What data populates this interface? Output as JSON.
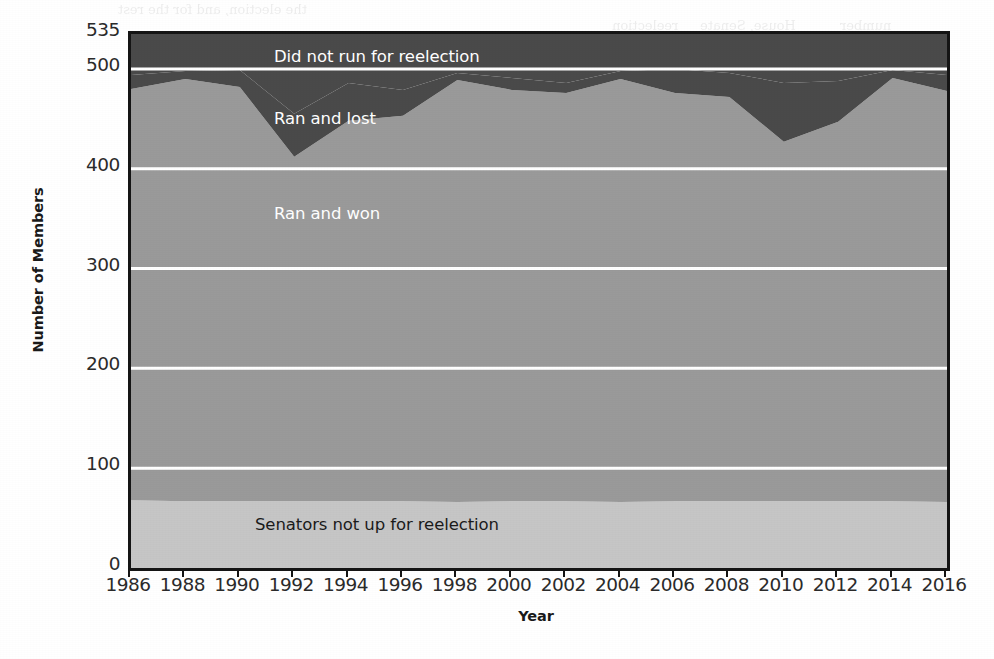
{
  "chart_data": {
    "type": "area",
    "stacked": true,
    "title": "",
    "xlabel": "Year",
    "ylabel": "Number of Members",
    "xlim": [
      1986,
      2016
    ],
    "ylim": [
      0,
      535
    ],
    "yticks": [
      0,
      100,
      200,
      300,
      400,
      500,
      535
    ],
    "ytick_labels": [
      "0",
      "100",
      "200",
      "300",
      "400",
      "500",
      "535"
    ],
    "xticks": [
      1986,
      1988,
      1990,
      1992,
      1994,
      1996,
      1998,
      2000,
      2002,
      2004,
      2006,
      2008,
      2010,
      2012,
      2014,
      2016
    ],
    "xtick_labels": [
      "1986",
      "1988",
      "1990",
      "1992",
      "1994",
      "1996",
      "1998",
      "2000",
      "2002",
      "2004",
      "2006",
      "2008",
      "2010",
      "2012",
      "2014",
      "2016"
    ],
    "x": [
      1986,
      1988,
      1990,
      1992,
      1994,
      1996,
      1998,
      2000,
      2002,
      2004,
      2006,
      2008,
      2010,
      2012,
      2014,
      2016
    ],
    "grid": "horizontal-white-gridlines",
    "legend": "inline-labels-on-bands",
    "series": [
      {
        "name": "Senators not up for reelection",
        "color": "#c6c6c6",
        "label_color": "#1b1b1b",
        "stack_order": 1,
        "values": [
          68,
          67,
          67,
          67,
          67,
          67,
          66,
          67,
          67,
          66,
          67,
          67,
          67,
          67,
          67,
          66
        ]
      },
      {
        "name": "Ran and won",
        "color": "#9a9a9a",
        "label_color": "#ffffff",
        "stack_order": 2,
        "values": [
          412,
          423,
          415,
          345,
          381,
          386,
          423,
          412,
          409,
          424,
          409,
          405,
          360,
          380,
          424,
          412
        ]
      },
      {
        "name": "Ran and lost",
        "color": "#4a4a4a",
        "label_color": "#ffffff",
        "stack_order": 3,
        "values": [
          14,
          8,
          17,
          43,
          38,
          26,
          7,
          12,
          10,
          8,
          24,
          24,
          59,
          41,
          8,
          16
        ]
      },
      {
        "name": "Did not run for reelection",
        "color": "#4a4a4a",
        "label_color": "#ffffff",
        "stack_order": 4,
        "values": [
          41,
          37,
          36,
          80,
          49,
          56,
          39,
          44,
          49,
          37,
          35,
          39,
          49,
          47,
          36,
          41
        ]
      }
    ],
    "cumulative_boundaries": {
      "note": "stacked running totals used to draw the band edges, bottom-up",
      "senators_top": [
        68,
        67,
        67,
        67,
        67,
        67,
        66,
        67,
        67,
        66,
        67,
        67,
        67,
        67,
        67,
        66
      ],
      "ran_and_won_top": [
        480,
        490,
        482,
        412,
        448,
        453,
        489,
        479,
        476,
        490,
        476,
        472,
        427,
        447,
        491,
        478
      ],
      "ran_and_lost_top": [
        494,
        498,
        499,
        455,
        486,
        479,
        496,
        491,
        486,
        498,
        500,
        496,
        486,
        488,
        499,
        494
      ],
      "total_top": [
        535,
        535,
        535,
        535,
        535,
        535,
        535,
        535,
        535,
        535,
        535,
        535,
        535,
        535,
        535,
        535
      ]
    },
    "band_labels": [
      {
        "text": "Did not run for reelection",
        "x_px": 271,
        "y_px": 44,
        "on": "dark"
      },
      {
        "text": "Ran and lost",
        "x_px": 271,
        "y_px": 106,
        "on": "dark"
      },
      {
        "text": "Ran and won",
        "x_px": 271,
        "y_px": 201,
        "on": "mid"
      },
      {
        "text": "Senators not up for reelection",
        "x_px": 252,
        "y_px": 512,
        "on": "light"
      }
    ],
    "colors": {
      "did_not_run": "#4a4a4a",
      "ran_and_lost": "#4a4a4a",
      "ran_and_won": "#9a9a9a",
      "senators_not_up": "#c6c6c6",
      "gridline": "#ffffff",
      "axis": "#151515",
      "background": "#ffffff",
      "text": "#2b2b2b"
    }
  },
  "page_artifacts": {
    "note": "faint ink bleed-through from the reverse side of the scanned page",
    "fragments": [
      {
        "text": "the election, and for the rest",
        "x_px": 118,
        "y_px": 2
      },
      {
        "text": "reelection",
        "x_px": 612,
        "y_px": 18
      },
      {
        "text": "House, Senate",
        "x_px": 700,
        "y_px": 18
      },
      {
        "text": "number",
        "x_px": 840,
        "y_px": 18
      }
    ]
  }
}
